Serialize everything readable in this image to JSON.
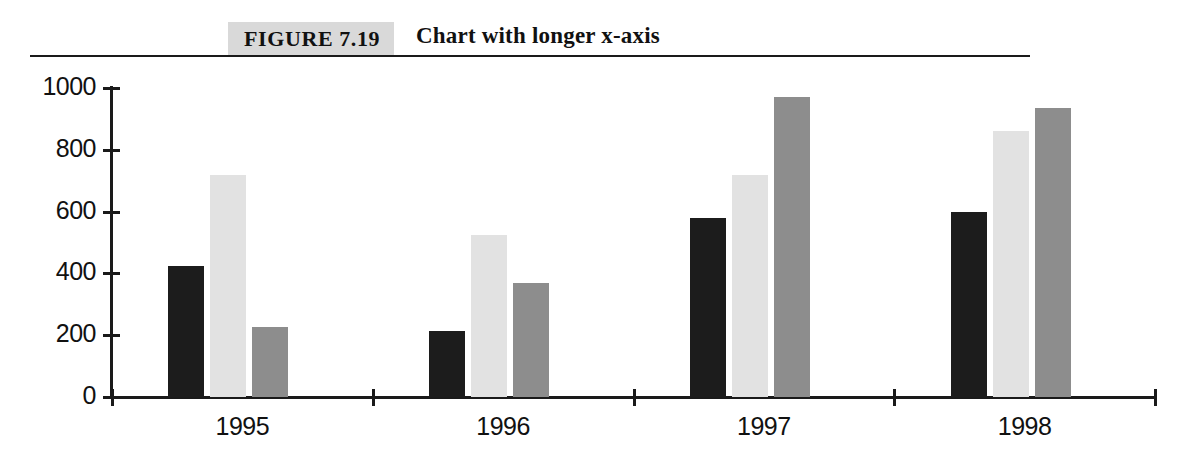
{
  "figure": {
    "tag": "FIGURE 7.19",
    "caption": "Chart with longer x-axis"
  },
  "chart_data": {
    "type": "bar",
    "title": "Chart with longer x-axis",
    "xlabel": "",
    "ylabel": "",
    "categories": [
      "1995",
      "1996",
      "1997",
      "1998"
    ],
    "series": [
      {
        "name": "Series 1",
        "color": "#1c1c1c",
        "values": [
          425,
          215,
          580,
          600
        ]
      },
      {
        "name": "Series 2",
        "color": "#e2e2e2",
        "values": [
          720,
          525,
          720,
          860
        ]
      },
      {
        "name": "Series 3",
        "color": "#8d8d8d",
        "values": [
          225,
          370,
          970,
          935
        ]
      }
    ],
    "ylim": [
      0,
      1000
    ],
    "ytick_labels": [
      "0",
      "200",
      "400",
      "600",
      "800",
      "1000"
    ],
    "ytick_values": [
      0,
      200,
      400,
      600,
      800,
      1000
    ],
    "grid": false,
    "legend": "none"
  }
}
